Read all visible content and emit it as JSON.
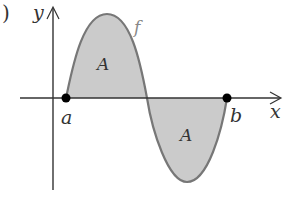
{
  "diagram": {
    "part_label": ")",
    "axes": {
      "x_label": "x",
      "y_label": "y"
    },
    "function_label": "f",
    "region_labels": [
      "A",
      "A"
    ],
    "points": [
      {
        "name": "a",
        "label": "a"
      },
      {
        "name": "b",
        "label": "b"
      }
    ],
    "colors": {
      "fill": "#c8c8c8",
      "curve": "#707070",
      "axis": "#333333",
      "point": "#000000"
    }
  }
}
